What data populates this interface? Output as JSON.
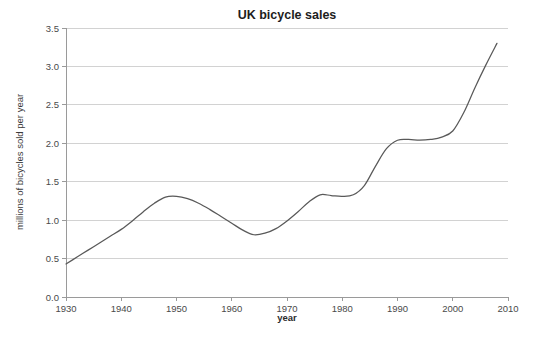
{
  "chart_data": {
    "type": "line",
    "title": "UK bicycle sales",
    "xlabel": "year",
    "ylabel": "millions of bicycles sold per year",
    "xlim": [
      1930,
      2010
    ],
    "ylim": [
      0.0,
      3.5
    ],
    "grid": true,
    "grid_axis": "y",
    "legend": "none",
    "xticks": [
      "1930",
      "1940",
      "1950",
      "1960",
      "1970",
      "1980",
      "1990",
      "2000",
      "2010"
    ],
    "xtick_values": [
      1930,
      1940,
      1950,
      1960,
      1970,
      1980,
      1990,
      2000,
      2010
    ],
    "yticks": [
      "0.0",
      "0.5",
      "1.0",
      "1.5",
      "2.0",
      "2.5",
      "3.0",
      "3.5"
    ],
    "ytick_values": [
      0.0,
      0.5,
      1.0,
      1.5,
      2.0,
      2.5,
      3.0,
      3.5
    ],
    "series": [
      {
        "name": "UK bicycle sales",
        "color": "#595959",
        "x": [
          1930,
          1932,
          1934,
          1936,
          1938,
          1940,
          1942,
          1944,
          1946,
          1948,
          1950,
          1952,
          1954,
          1956,
          1958,
          1960,
          1962,
          1964,
          1966,
          1968,
          1970,
          1972,
          1974,
          1976,
          1978,
          1980,
          1982,
          1984,
          1986,
          1988,
          1990,
          1992,
          1994,
          1996,
          1998,
          2000,
          2002,
          2004,
          2006,
          2008
        ],
        "values": [
          0.43,
          0.52,
          0.61,
          0.7,
          0.79,
          0.88,
          0.99,
          1.11,
          1.22,
          1.3,
          1.31,
          1.28,
          1.22,
          1.14,
          1.05,
          0.96,
          0.87,
          0.81,
          0.83,
          0.89,
          0.99,
          1.11,
          1.24,
          1.33,
          1.32,
          1.31,
          1.33,
          1.45,
          1.7,
          1.93,
          2.04,
          2.05,
          2.04,
          2.05,
          2.08,
          2.16,
          2.4,
          2.72,
          3.02,
          3.3
        ]
      }
    ],
    "annotations": {
      "peak_1948": 1.31,
      "trough_1964": 0.81,
      "plateau_1976_1982": 1.32,
      "plateau_1990_1996": 2.05,
      "end_2008": 3.3
    }
  },
  "figure": {
    "background_color": "#ffffff",
    "gridline_color": "#d2d2d2",
    "axis_color": "#9a9a9a",
    "line_color": "#595959"
  }
}
